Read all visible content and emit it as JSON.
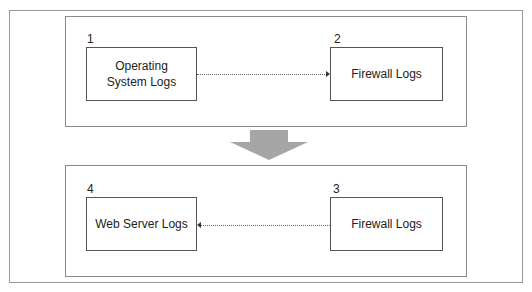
{
  "diagram": {
    "top_group": {
      "nodes": [
        {
          "number": "1",
          "label": "Operating System Logs"
        },
        {
          "number": "2",
          "label": "Firewall Logs"
        }
      ],
      "edge": {
        "from": "1",
        "to": "2",
        "direction": "right"
      }
    },
    "transition_arrow": {
      "direction": "down",
      "color": "#a6a6a6"
    },
    "bottom_group": {
      "nodes": [
        {
          "number": "4",
          "label": "Web Server Logs"
        },
        {
          "number": "3",
          "label": "Firewall Logs"
        }
      ],
      "edge": {
        "from": "3",
        "to": "4",
        "direction": "left"
      }
    }
  }
}
